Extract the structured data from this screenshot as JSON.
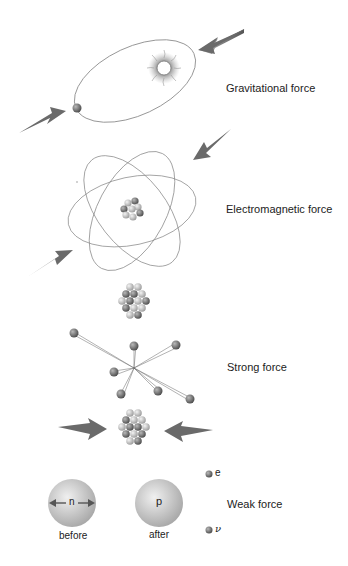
{
  "diagram": {
    "sections": [
      {
        "id": "gravitational",
        "label": "Gravitational force"
      },
      {
        "id": "electromagnetic",
        "label": "Electromagnetic force"
      },
      {
        "id": "strong",
        "label": "Strong force"
      },
      {
        "id": "weak",
        "label": "Weak force"
      }
    ],
    "weak": {
      "before_label": "before",
      "after_label": "after",
      "neutron_symbol": "n",
      "proton_symbol": "p",
      "electron_symbol": "e",
      "neutrino_symbol": "ν"
    },
    "colors": {
      "arrow": "#6e6e6e",
      "orbit": "#8a8a8a",
      "particle_light": "#d8d8d8",
      "particle_dark": "#707070",
      "nucleon_sphere": "#cfcfcf"
    }
  }
}
